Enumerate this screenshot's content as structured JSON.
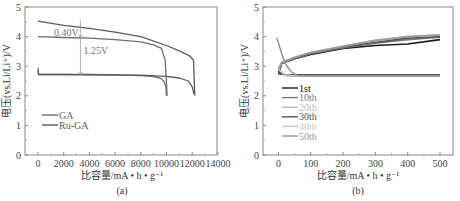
{
  "chart_data": [
    {
      "type": "line",
      "panel": "(a)",
      "title": "",
      "xlabel": "比容量/mA • h • g⁻¹",
      "ylabel": "电压(vs.Li/Li⁺)/V",
      "xlim": [
        -1000,
        14000
      ],
      "ylim": [
        0,
        5
      ],
      "xticks": [
        "0",
        "2000",
        "4000",
        "6000",
        "8000",
        "10000",
        "12000",
        "14000"
      ],
      "yticks": [
        "0",
        "1",
        "2",
        "3",
        "4",
        "5"
      ],
      "grid": false,
      "legend_position": "lower-left",
      "annotations": [
        {
          "text": "0.40V",
          "x": 3300,
          "y_from": 4.35,
          "y_to": 3.95
        },
        {
          "text": "1.25V",
          "x": 3300,
          "y_from": 3.95,
          "y_to": 2.7
        }
      ],
      "series": [
        {
          "name": "GA",
          "color": "#6e6e6e",
          "charge": {
            "x": [
              0,
              2000,
              4000,
              6000,
              8000,
              9000,
              9600,
              9900,
              10000,
              10050
            ],
            "y": [
              4.0,
              3.97,
              3.95,
              3.9,
              3.82,
              3.72,
              3.6,
              3.2,
              2.4,
              2.0
            ]
          },
          "discharge": {
            "x": [
              0,
              50,
              2000,
              4000,
              6000,
              8000,
              9000,
              9500,
              9800,
              9950,
              10000
            ],
            "y": [
              2.95,
              2.72,
              2.72,
              2.71,
              2.7,
              2.68,
              2.65,
              2.6,
              2.5,
              2.3,
              2.0
            ]
          }
        },
        {
          "name": "Ru-GA",
          "color": "#5a5a5a",
          "charge": {
            "x": [
              0,
              2000,
              4000,
              6000,
              8000,
              10000,
              11000,
              11800,
              12100,
              12200
            ],
            "y": [
              4.52,
              4.38,
              4.28,
              4.15,
              4.0,
              3.7,
              3.52,
              3.35,
              3.2,
              2.0
            ]
          },
          "discharge": {
            "x": [
              0,
              50,
              2000,
              4000,
              6000,
              8000,
              10000,
              11000,
              11700,
              12000,
              12150
            ],
            "y": [
              2.85,
              2.72,
              2.72,
              2.72,
              2.71,
              2.7,
              2.66,
              2.6,
              2.5,
              2.3,
              2.05
            ]
          }
        }
      ]
    },
    {
      "type": "line",
      "panel": "(b)",
      "title": "",
      "xlabel": "比容量/mA • h • g⁻¹",
      "ylabel": "电压(vs.Li/Li⁺)/V",
      "xlim": [
        -50,
        550
      ],
      "ylim": [
        0,
        5
      ],
      "xticks": [
        "0",
        "100",
        "200",
        "300",
        "400",
        "500"
      ],
      "yticks": [
        "0",
        "1",
        "2",
        "3",
        "4",
        "5"
      ],
      "grid": false,
      "legend_position": "lower-left",
      "series": [
        {
          "name": "1st",
          "color": "#1a1a1a",
          "charge": {
            "x": [
              0,
              10,
              50,
              100,
              200,
              300,
              400,
              500
            ],
            "y": [
              2.75,
              3.1,
              3.25,
              3.4,
              3.6,
              3.7,
              3.75,
              3.9
            ]
          },
          "discharge": {
            "x": [
              0,
              20,
              60,
              100,
              500
            ],
            "y": [
              2.75,
              2.72,
              2.7,
              2.7,
              2.7
            ]
          }
        },
        {
          "name": "10th",
          "color": "#7a7a7a",
          "charge": {
            "x": [
              0,
              10,
              50,
              100,
              200,
              300,
              400,
              500
            ],
            "y": [
              2.8,
              3.1,
              3.25,
              3.42,
              3.63,
              3.78,
              3.9,
              3.98
            ]
          },
          "discharge": {
            "x": [
              0,
              20,
              60,
              100,
              500
            ],
            "y": [
              2.8,
              2.7,
              2.67,
              2.67,
              2.67
            ]
          }
        },
        {
          "name": "20th",
          "color": "#bdbdbd",
          "charge": {
            "x": [
              0,
              10,
              50,
              100,
              200,
              300,
              400,
              500
            ],
            "y": [
              2.85,
              3.12,
              3.28,
              3.45,
              3.66,
              3.85,
              3.98,
              4.03
            ]
          },
          "discharge": {
            "x": [
              0,
              20,
              60,
              100,
              500
            ],
            "y": [
              2.85,
              2.7,
              2.67,
              2.67,
              2.67
            ]
          }
        },
        {
          "name": "30th",
          "color": "#555555",
          "charge": {
            "x": [
              0,
              10,
              50,
              100,
              200,
              300,
              400,
              500
            ],
            "y": [
              2.8,
              3.1,
              3.27,
              3.44,
              3.65,
              3.8,
              3.95,
              4.0
            ]
          },
          "discharge": {
            "x": [
              0,
              20,
              60,
              100,
              500
            ],
            "y": [
              2.8,
              2.7,
              2.67,
              2.67,
              2.67
            ]
          }
        },
        {
          "name": "40th",
          "color": "#c8c8c8",
          "charge": {
            "x": [
              0,
              10,
              50,
              100,
              200,
              300,
              400,
              500
            ],
            "y": [
              2.9,
              3.13,
              3.3,
              3.47,
              3.68,
              3.88,
              4.0,
              4.05
            ]
          },
          "discharge": {
            "x": [
              0,
              20,
              60,
              100,
              500
            ],
            "y": [
              2.9,
              2.7,
              2.66,
              2.66,
              2.66
            ]
          }
        },
        {
          "name": "50th",
          "color": "#999999",
          "charge": {
            "x": [
              0,
              10,
              50,
              100,
              200,
              300,
              400,
              500
            ],
            "y": [
              2.9,
              3.13,
              3.3,
              3.46,
              3.67,
              3.87,
              4.0,
              4.06
            ]
          },
          "discharge": {
            "x": [
              -5,
              5,
              20,
              40,
              60,
              100,
              500
            ],
            "y": [
              3.95,
              3.6,
              3.1,
              2.8,
              2.68,
              2.66,
              2.66
            ]
          }
        }
      ]
    }
  ],
  "captions": {
    "a": "(a)",
    "b": "(b)"
  }
}
